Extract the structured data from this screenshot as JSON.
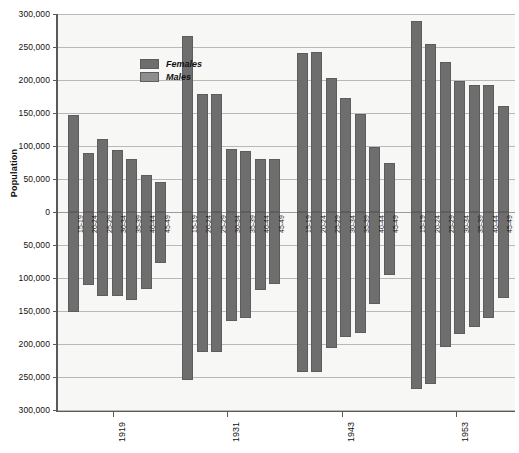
{
  "chart_data": {
    "type": "bar",
    "title": "",
    "subtitle": "",
    "xlabel": "",
    "ylabel": "Population",
    "orientation": "vertical-mirrored-population-pyramid",
    "grid": true,
    "legend_position": "top-left-inside",
    "y_axis": {
      "zero_at_center": true,
      "tick_labels": [
        "300,000",
        "250,000",
        "200,000",
        "150,000",
        "100,000",
        "50,000",
        "0",
        "50,000",
        "100,000",
        "150,000",
        "200,000",
        "250,000",
        "300,000"
      ],
      "tick_values_signed": [
        300000,
        250000,
        200000,
        150000,
        100000,
        50000,
        0,
        -50000,
        -100000,
        -150000,
        -200000,
        -250000,
        -300000
      ],
      "ylim": [
        -300000,
        300000
      ],
      "upper_half_series": "Females",
      "lower_half_series": "Males"
    },
    "x_axis": {
      "group_labels": [
        "1919",
        "1931",
        "1943",
        "1953"
      ],
      "categories": [
        "15-19",
        "20-24",
        "25-29",
        "30-34",
        "35-39",
        "40-44",
        "45-49"
      ]
    },
    "legend": [
      {
        "name": "Females",
        "color": "#6e6e6e"
      },
      {
        "name": "Males",
        "color": "#8e8e8e"
      }
    ],
    "groups": [
      {
        "year": "1919",
        "bars": [
          {
            "age": "15-19",
            "females": 147000,
            "males": 151000
          },
          {
            "age": "20-24",
            "females": 89000,
            "males": 111000
          },
          {
            "age": "25-29",
            "females": 111000,
            "males": 128000
          },
          {
            "age": "30-34",
            "females": 94000,
            "males": 127000
          },
          {
            "age": "35-39",
            "females": 80000,
            "males": 133000
          },
          {
            "age": "40-44",
            "females": 56000,
            "males": 117000
          },
          {
            "age": "45-49",
            "females": 45000,
            "males": 78000
          }
        ]
      },
      {
        "year": "1931",
        "bars": [
          {
            "age": "15-19",
            "females": 266000,
            "males": 255000
          },
          {
            "age": "20-24",
            "females": 179000,
            "males": 212000
          },
          {
            "age": "25-29",
            "females": 179000,
            "males": 212000
          },
          {
            "age": "30-34",
            "females": 95000,
            "males": 165000
          },
          {
            "age": "35-39",
            "females": 93000,
            "males": 161000
          },
          {
            "age": "40-44",
            "females": 81000,
            "males": 118000
          },
          {
            "age": "45-49",
            "females": 81000,
            "males": 109000
          }
        ]
      },
      {
        "year": "1943",
        "bars": [
          {
            "age": "15-19",
            "females": 241000,
            "males": 242000
          },
          {
            "age": "20-24",
            "females": 243000,
            "males": 243000
          },
          {
            "age": "25-29",
            "females": 203000,
            "males": 206000
          },
          {
            "age": "30-34",
            "females": 173000,
            "males": 189000
          },
          {
            "age": "35-39",
            "females": 149000,
            "males": 184000
          },
          {
            "age": "40-44",
            "females": 98000,
            "males": 140000
          },
          {
            "age": "45-49",
            "females": 74000,
            "males": 95000
          }
        ]
      },
      {
        "year": "1953",
        "bars": [
          {
            "age": "15-19",
            "females": 289000,
            "males": 268000
          },
          {
            "age": "20-24",
            "females": 255000,
            "males": 261000
          },
          {
            "age": "25-29",
            "females": 228000,
            "males": 205000
          },
          {
            "age": "30-34",
            "females": 199000,
            "males": 185000
          },
          {
            "age": "35-39",
            "females": 193000,
            "males": 174000
          },
          {
            "age": "40-44",
            "females": 192000,
            "males": 160000
          },
          {
            "age": "45-49",
            "females": 161000,
            "males": 131000
          }
        ]
      }
    ]
  }
}
